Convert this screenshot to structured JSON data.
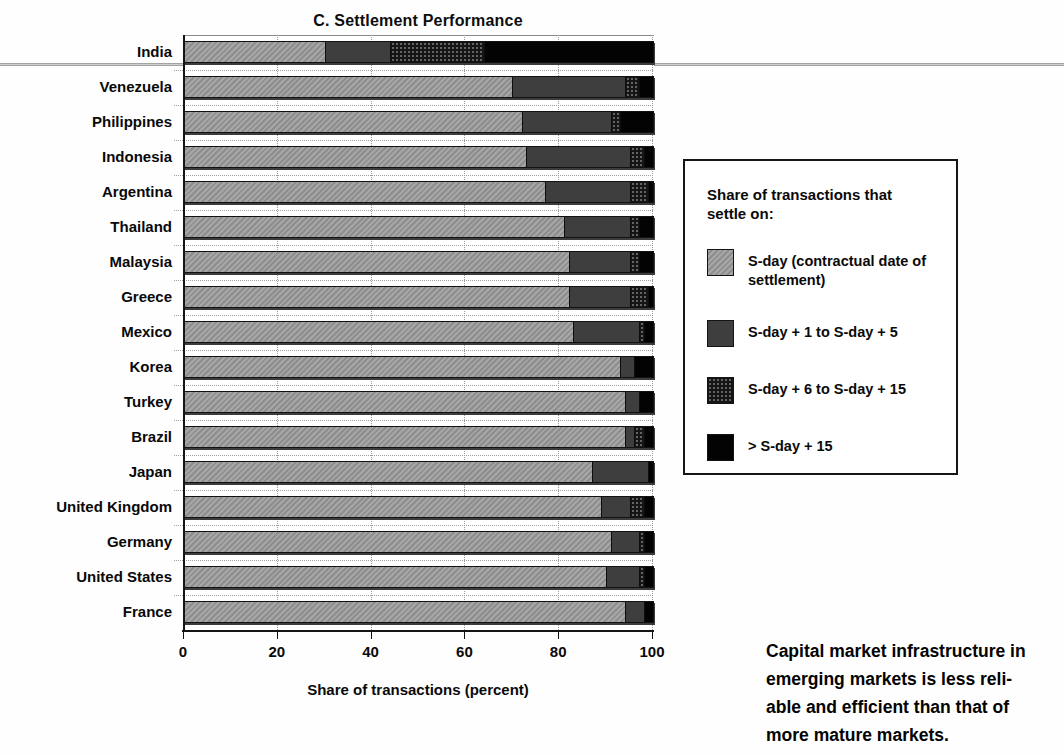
{
  "caption": "Capital market infrastructure in\nemerging markets is less reli-\nable and efficient than that of\nmore mature markets.",
  "colors": {
    "s_day": "#9a9a9a",
    "s_day_1_5": "#3e3e3e",
    "s_day_6_15": "#151515",
    "s_day_15_plus": "#030303",
    "page_rule": "#8d8d8d"
  },
  "chart_data": {
    "type": "bar",
    "orientation": "horizontal",
    "stacked": true,
    "title": "C. Settlement Performance",
    "xlabel": "Share of transactions (percent)",
    "xlim": [
      0,
      100
    ],
    "xticks": [
      0,
      20,
      40,
      60,
      80,
      100
    ],
    "grid": true,
    "categories": [
      "India",
      "Venezuela",
      "Philippines",
      "Indonesia",
      "Argentina",
      "Thailand",
      "Malaysia",
      "Greece",
      "Mexico",
      "Korea",
      "Turkey",
      "Brazil",
      "Japan",
      "United Kingdom",
      "Germany",
      "United States",
      "France"
    ],
    "series": [
      {
        "name": "S-day (contractual date of settlement)",
        "style": "hatch-gray",
        "color": "#9a9a9a",
        "values": [
          30,
          70,
          72,
          73,
          77,
          81,
          82,
          82,
          83,
          93,
          94,
          94,
          87,
          89,
          91,
          90,
          94
        ]
      },
      {
        "name": "S-day + 1 to S-day + 5",
        "style": "solid-darkgray",
        "color": "#3e3e3e",
        "values": [
          14,
          24,
          19,
          22,
          18,
          14,
          13,
          13,
          14,
          3,
          3,
          2,
          12,
          6,
          6,
          7,
          4
        ]
      },
      {
        "name": "S-day + 6 to S-day + 15",
        "style": "speckled-black",
        "color": "#151515",
        "values": [
          20,
          3,
          2,
          3,
          4,
          2,
          2,
          4,
          1,
          0,
          0,
          2,
          0,
          3,
          1,
          1,
          0
        ]
      },
      {
        "name": "> S-day + 15",
        "style": "solid-black",
        "color": "#030303",
        "values": [
          36,
          3,
          7,
          2,
          1,
          3,
          3,
          1,
          2,
          4,
          3,
          2,
          1,
          2,
          2,
          2,
          2
        ]
      }
    ],
    "legend": {
      "header": "Share of transactions that\nsettle on:",
      "position": "right"
    }
  }
}
